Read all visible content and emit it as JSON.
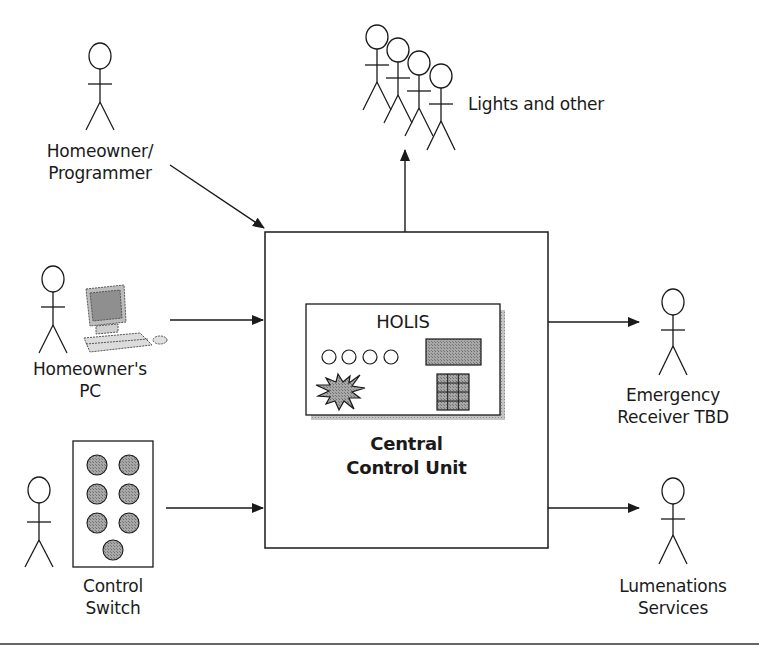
{
  "diagram": {
    "type": "context-diagram",
    "central_unit": {
      "panel_title": "HOLIS",
      "label_line1": "Central",
      "label_line2": "Control Unit",
      "panel_indicator_count": 4,
      "keypad_grid": "3x4"
    },
    "actors": [
      {
        "id": "homeowner-programmer",
        "line1": "Homeowner/",
        "line2": "Programmer",
        "direction": "input"
      },
      {
        "id": "homeowners-pc",
        "line1": "Homeowner's",
        "line2": "PC",
        "direction": "input"
      },
      {
        "id": "control-switch",
        "line1": "Control",
        "line2": "Switch",
        "direction": "input",
        "button_count": 7
      },
      {
        "id": "lights-and-other",
        "line1": "Lights and other",
        "direction": "output",
        "figure_count": 4
      },
      {
        "id": "emergency-receiver",
        "line1": "Emergency",
        "line2": "Receiver TBD",
        "direction": "output"
      },
      {
        "id": "lumenations-services",
        "line1": "Lumenations",
        "line2": "Services",
        "direction": "output"
      }
    ],
    "colors": {
      "line": "#1a1a1a",
      "fill_gray": "#9a9a9a",
      "shadow": "#b5b5b5",
      "background": "#ffffff"
    }
  }
}
